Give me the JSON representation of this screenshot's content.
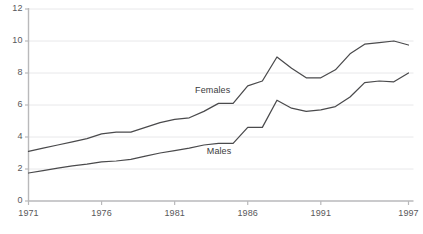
{
  "chart_data": {
    "type": "line",
    "title": "",
    "subtitle": "",
    "xlabel": "",
    "ylabel": "",
    "xlim": [
      1971,
      1997
    ],
    "ylim": [
      0,
      12
    ],
    "grid": true,
    "legend_position": "inline-annotation",
    "y_ticks": [
      0,
      2,
      4,
      6,
      8,
      10,
      12
    ],
    "y_tick_labels": [
      "0",
      "2",
      "4",
      "6",
      "8",
      "10",
      "12"
    ],
    "x_ticks": [
      1971,
      1976,
      1981,
      1986,
      1991,
      1997
    ],
    "x_tick_labels": [
      "1971",
      "1976",
      "1981",
      "1986",
      "1991",
      "1997"
    ],
    "x": [
      1971,
      1972,
      1973,
      1974,
      1975,
      1976,
      1977,
      1978,
      1979,
      1980,
      1981,
      1982,
      1983,
      1984,
      1985,
      1986,
      1987,
      1988,
      1989,
      1990,
      1991,
      1992,
      1993,
      1994,
      1995,
      1996,
      1997
    ],
    "series": [
      {
        "name": "Females",
        "color": "#4a4a4c",
        "label_x": 1982.4,
        "label_y": 6.85,
        "values": [
          3.1,
          3.3,
          3.5,
          3.7,
          3.9,
          4.2,
          4.3,
          4.3,
          4.6,
          4.9,
          5.1,
          5.2,
          5.6,
          6.1,
          6.1,
          7.2,
          7.5,
          9.0,
          8.3,
          7.7,
          7.7,
          8.2,
          9.2,
          9.8,
          9.9,
          10.0,
          9.75
        ]
      },
      {
        "name": "Males",
        "color": "#4a4a4c",
        "label_x": 1983.2,
        "label_y": 3.05,
        "values": [
          1.75,
          1.9,
          2.05,
          2.2,
          2.3,
          2.45,
          2.5,
          2.6,
          2.8,
          3.0,
          3.15,
          3.3,
          3.5,
          3.6,
          3.6,
          4.6,
          4.6,
          6.3,
          5.8,
          5.6,
          5.7,
          5.9,
          6.5,
          7.4,
          7.5,
          7.45,
          8.0
        ]
      }
    ]
  },
  "colors": {
    "line": "#4a4a4c",
    "grid": "#e8e8ea",
    "axis": "#b9b9bb",
    "tick_text": "#58585a",
    "label_text": "#3b3b3d",
    "background": "#ffffff"
  }
}
